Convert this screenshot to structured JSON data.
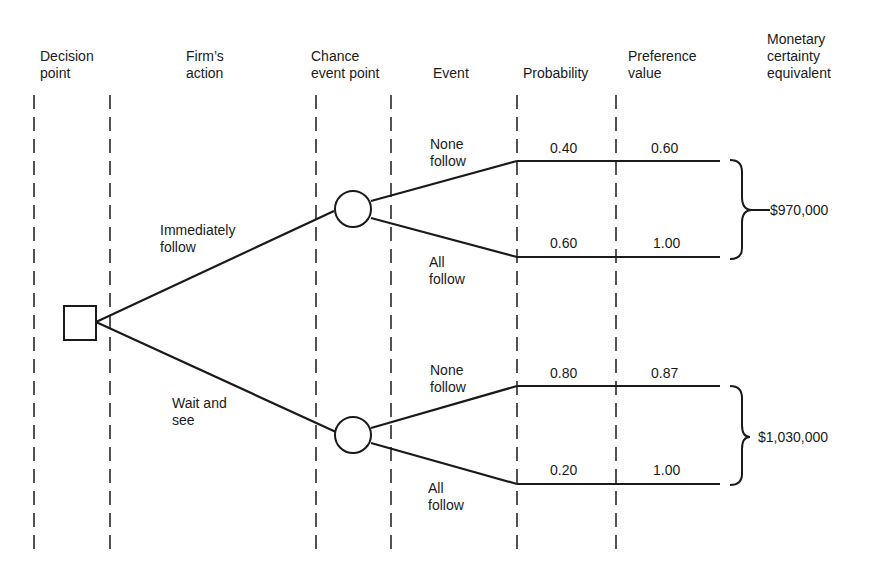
{
  "headers": {
    "decision_point": "Decision\npoint",
    "firms_action": "Firm’s\naction",
    "chance_event_point": "Chance\nevent point",
    "event": "Event",
    "probability": "Probability",
    "preference_value": "Preference\nvalue",
    "monetary_ce": "Monetary\ncertainty\nequivalent"
  },
  "actions": [
    {
      "label": "Immediately\nfollow"
    },
    {
      "label": "Wait and\nsee"
    }
  ],
  "outcomes": [
    {
      "event": "None\nfollow",
      "probability": "0.40",
      "preference": "0.60"
    },
    {
      "event": "All\nfollow",
      "probability": "0.60",
      "preference": "1.00"
    },
    {
      "event": "None\nfollow",
      "probability": "0.80",
      "preference": "0.87"
    },
    {
      "event": "All\nfollow",
      "probability": "0.20",
      "preference": "1.00"
    }
  ],
  "certainty_equivalents": [
    "$970,000",
    "$1,030,000"
  ],
  "colors": {
    "ink": "#1a1a1a",
    "background": "#ffffff"
  }
}
